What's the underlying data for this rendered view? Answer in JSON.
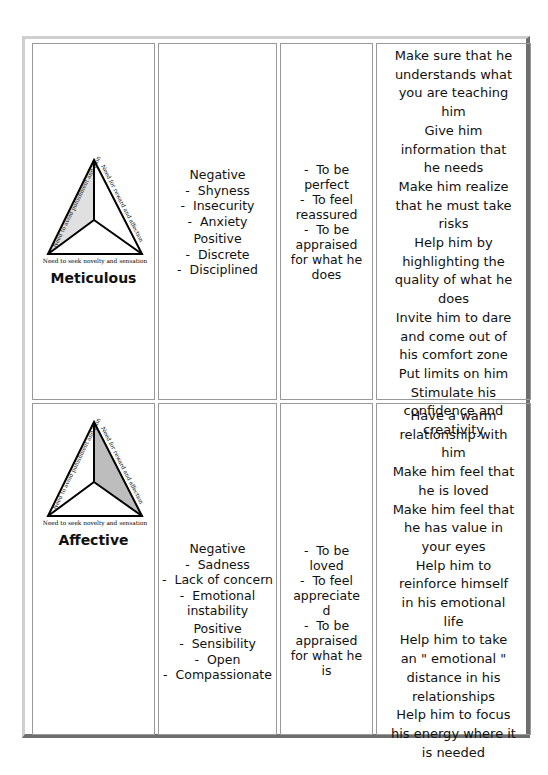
{
  "rows": [
    {
      "profile": {
        "name": "Meticulous",
        "diagram": {
          "left_label": "Need to avoid punishment and pain",
          "right_label": "Need for reward and affection",
          "bottom_label": "Need to seek novelty and sensation",
          "shaded_section": "left",
          "shade_color": "#e0e0e0"
        }
      },
      "traits": {
        "negative_label": "Negative",
        "negative": [
          "Shyness",
          "Insecurity",
          "Anxiety"
        ],
        "positive_label": "Positive",
        "positive": [
          "Discrete",
          "Disciplined"
        ]
      },
      "needs": [
        "To be",
        "perfect",
        "To feel",
        "reassured",
        "To be",
        "appraised",
        "for what he",
        "does"
      ],
      "tips": [
        "Make sure that he",
        "understands what",
        "you are teaching",
        "him",
        "Give him",
        "information that",
        "he needs",
        "Make him realize",
        "that he must take",
        "risks",
        "Help him by",
        "highlighting the",
        "quality of what he",
        "does",
        "Invite him to dare",
        "and come out of",
        "his comfort zone",
        "Put limits on him",
        "Stimulate his",
        "confidence and",
        "creativity"
      ]
    },
    {
      "profile": {
        "name": "Affective",
        "diagram": {
          "left_label": "Need to avoid punishment and pain",
          "right_label": "Need for reward and affection",
          "bottom_label": "Need to seek novelty and sensation",
          "shaded_section": "right",
          "shade_color": "#bdbdbd"
        }
      },
      "traits": {
        "negative_label": "Negative",
        "negative": [
          "Sadness",
          "Lack of concern",
          "Emotional instability"
        ],
        "positive_label": "Positive",
        "positive": [
          "Sensibility",
          "Open",
          "Compassionate"
        ]
      },
      "needs": [
        "To be",
        "loved",
        "To feel",
        "appreciate",
        "d",
        "To be",
        "appraised",
        "for what he",
        "is"
      ],
      "tips": [
        "Have a warm",
        "relationship with",
        "him",
        "Make him feel that",
        "he is loved",
        "Make him feel that",
        "he has value in",
        "your eyes",
        "Help him to",
        "reinforce himself",
        "in his emotional",
        "life",
        "Help him to take",
        "an \" emotional \"",
        "distance in his",
        "relationships",
        "Help him to focus",
        "his energy where it",
        "is needed"
      ]
    }
  ]
}
